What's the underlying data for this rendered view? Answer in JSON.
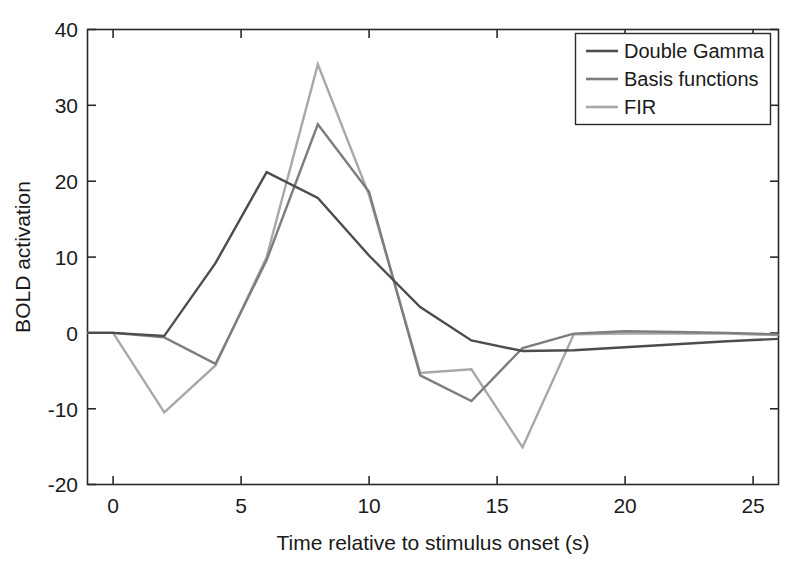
{
  "chart_data": {
    "type": "line",
    "title": "",
    "xlabel": "Time relative to stimulus onset (s)",
    "ylabel": "BOLD activation",
    "xlim": [
      -1,
      26
    ],
    "ylim": [
      -20,
      40
    ],
    "xticks": [
      0,
      5,
      10,
      15,
      20,
      25
    ],
    "yticks": [
      -20,
      -10,
      0,
      10,
      20,
      30,
      40
    ],
    "xtick_labels": [
      "0",
      "5",
      "10",
      "15",
      "20",
      "25"
    ],
    "ytick_labels": [
      "-20",
      "-10",
      "0",
      "10",
      "20",
      "30",
      "40"
    ],
    "grid": false,
    "legend_position": "top-right",
    "colors": {
      "double_gamma": "#4d4d4d",
      "basis_functions": "#7d7d7d",
      "fir": "#a8a8a8",
      "axis": "#2a2a2a",
      "background": "#ffffff"
    },
    "x": [
      -1,
      0,
      2,
      4,
      6,
      8,
      10,
      12,
      14,
      16,
      18,
      20,
      22,
      24,
      26
    ],
    "series": [
      {
        "name": "Double Gamma",
        "color": "#4d4d4d",
        "values": [
          0,
          0,
          -0.4,
          9.2,
          21.2,
          17.8,
          10.2,
          3.4,
          -1.0,
          -2.4,
          -2.3,
          -1.9,
          -1.5,
          -1.1,
          -0.8
        ]
      },
      {
        "name": "Basis functions",
        "color": "#7d7d7d",
        "values": [
          0,
          0,
          -0.6,
          -4.1,
          9.6,
          27.5,
          18.6,
          -5.6,
          -9.0,
          -2.0,
          -0.1,
          0.2,
          0.1,
          0.0,
          -0.2
        ]
      },
      {
        "name": "FIR",
        "color": "#a8a8a8",
        "values": [
          0,
          0,
          -10.5,
          -4.3,
          10.0,
          35.4,
          18.2,
          -5.3,
          -4.8,
          -15.1,
          -0.2,
          -0.1,
          -0.1,
          -0.1,
          -0.3
        ]
      }
    ]
  },
  "legend": {
    "entries": [
      {
        "label": "Double Gamma"
      },
      {
        "label": "Basis functions"
      },
      {
        "label": "FIR"
      }
    ]
  },
  "axes": {
    "x_axis_title": "Time relative to stimulus onset (s)",
    "y_axis_title": "BOLD activation",
    "x_tick_0": "0",
    "x_tick_1": "5",
    "x_tick_2": "10",
    "x_tick_3": "15",
    "x_tick_4": "20",
    "x_tick_5": "25",
    "y_tick_0": "40",
    "y_tick_1": "30",
    "y_tick_2": "20",
    "y_tick_3": "10",
    "y_tick_4": "0",
    "y_tick_5": "-10",
    "y_tick_6": "-20"
  }
}
